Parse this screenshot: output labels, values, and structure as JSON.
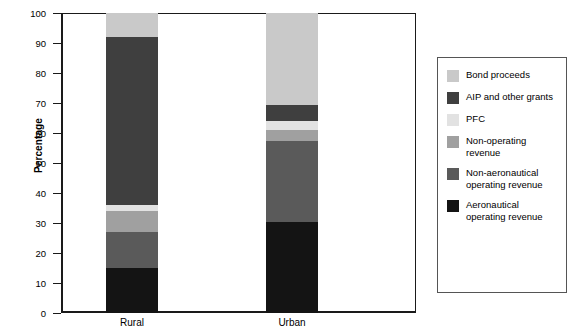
{
  "chart_data": {
    "type": "bar",
    "title": "",
    "subtitle": "",
    "xlabel": "",
    "ylabel": "Percentage",
    "ylim": [
      0,
      100
    ],
    "ytick_labels": [
      "100",
      "90",
      "80",
      "70",
      "60",
      "50",
      "40",
      "30",
      "20",
      "10",
      "0"
    ],
    "ytick_values": [
      100,
      90,
      80,
      70,
      60,
      50,
      40,
      30,
      20,
      10,
      0
    ],
    "grid": false,
    "stacked": true,
    "legend_position": "right",
    "categories": [
      "Rural",
      "Urban"
    ],
    "series": [
      {
        "name": "Bond proceeds",
        "color": "#c9c9c9",
        "values": [
          8,
          30.5
        ]
      },
      {
        "name": "AIP and other grants",
        "color": "#3f3f3f",
        "values": [
          56,
          5.5
        ]
      },
      {
        "name": "PFC",
        "color": "#e2e2e2",
        "values": [
          2,
          3
        ]
      },
      {
        "name": "Non-operating revenue",
        "color": "#a0a0a0",
        "values": [
          7,
          3.5
        ]
      },
      {
        "name": "Non-aeronautical operating revenue",
        "color": "#5a5a5a",
        "values": [
          12,
          27
        ]
      },
      {
        "name": "Aeronautical operating revenue",
        "color": "#141414",
        "values": [
          15,
          30.5
        ]
      }
    ]
  },
  "legend": {
    "items": [
      {
        "label": "Bond proceeds",
        "color": "#c9c9c9"
      },
      {
        "label": "AIP and other grants",
        "color": "#3f3f3f"
      },
      {
        "label": "PFC",
        "color": "#e2e2e2"
      },
      {
        "label": "Non-operating revenue",
        "color": "#a0a0a0"
      },
      {
        "label": "Non-aeronautical operating revenue",
        "color": "#5a5a5a"
      },
      {
        "label": "Aeronautical operating revenue",
        "color": "#141414"
      }
    ]
  },
  "axis": {
    "y_title": "Percentage"
  }
}
